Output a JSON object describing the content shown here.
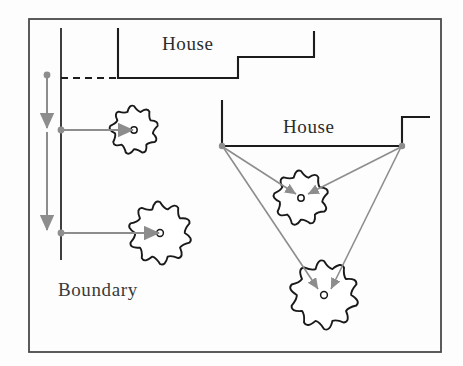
{
  "figure": {
    "title_visible": false,
    "background_color": "#fdfdfd",
    "frame": {
      "name": "outer-frame",
      "x": 29,
      "y": 19,
      "width": 412,
      "height": 333,
      "stroke": "#4a4a4a",
      "stroke_width": 1.8
    }
  },
  "labels": {
    "house_top": "House",
    "house_right": "House",
    "boundary": "Boundary"
  },
  "label_positions": {
    "house_top": {
      "x": 162,
      "y": 50
    },
    "house_right": {
      "x": 283,
      "y": 133
    },
    "boundary": {
      "x": 58,
      "y": 296
    }
  },
  "colors": {
    "structure_stroke": "#1c1c1c",
    "frame_stroke": "#4a4a4a",
    "arrow_grey": "#8d8d8d",
    "tree_stroke": "#1a1a1a",
    "tree_fill": "#ffffff",
    "text": "#2b2b2b"
  },
  "boundary_line": {
    "name": "boundary-vertical-line",
    "x": 61,
    "y_top": 28,
    "y_bottom": 260,
    "stroke": "#1c1c1c",
    "stroke_width": 1.6
  },
  "dashed_setback": {
    "name": "dashed-setback-line",
    "x1": 61,
    "y1": 78,
    "x2": 118,
    "y2": 78,
    "dash": "7,5",
    "stroke": "#1c1c1c",
    "stroke_width": 1.8
  },
  "houses": [
    {
      "id": "house-top",
      "label": "House",
      "points": "118,28 118,78 238,78 238,57 314,57 314,31",
      "stroke": "#1c1c1c",
      "stroke_width": 2.0
    },
    {
      "id": "house-right",
      "label": "House",
      "points": "222,100 222,146 402,146 402,117 430,117",
      "stroke": "#1c1c1c",
      "stroke_width": 2.0
    }
  ],
  "trees": [
    {
      "id": "tree-upper-left",
      "cx": 134,
      "cy": 130,
      "r": 24,
      "lobes": 9,
      "core_r": 3.2
    },
    {
      "id": "tree-lower-left",
      "cx": 160,
      "cy": 233,
      "r": 31,
      "lobes": 10,
      "core_r": 3.4
    },
    {
      "id": "tree-mid-right",
      "cx": 301,
      "cy": 198,
      "r": 27,
      "lobes": 9,
      "core_r": 3.2
    },
    {
      "id": "tree-lower-right",
      "cx": 324,
      "cy": 295,
      "r": 34,
      "lobes": 10,
      "core_r": 3.4
    }
  ],
  "measure_column": {
    "name": "vertical-measure-arrows",
    "x": 47,
    "dot": {
      "x": 47,
      "y": 75,
      "r": 3.4
    },
    "arrow_segments": [
      {
        "from_y": 75,
        "to_y": 130
      },
      {
        "from_y": 130,
        "to_y": 232
      }
    ],
    "stroke": "#8d8d8d",
    "stroke_width": 2.0
  },
  "horizontal_arrows": [
    {
      "id": "arrow-to-tree-upper-left",
      "x1": 61,
      "y1": 130,
      "x2": 134,
      "y2": 130,
      "origin_dot": true
    },
    {
      "id": "arrow-to-tree-lower-left",
      "x1": 61,
      "y1": 233,
      "x2": 160,
      "y2": 233,
      "origin_dot": true
    }
  ],
  "radial_arrows": [
    {
      "id": "arrow-left-corner-to-mid-tree",
      "x1": 222,
      "y1": 146,
      "x2": 301,
      "y2": 198,
      "origin_dot": true
    },
    {
      "id": "arrow-right-corner-to-mid-tree",
      "x1": 402,
      "y1": 146,
      "x2": 301,
      "y2": 198,
      "origin_dot": true
    },
    {
      "id": "arrow-left-corner-to-lower-tree",
      "x1": 222,
      "y1": 146,
      "x2": 324,
      "y2": 295,
      "origin_dot": true
    },
    {
      "id": "arrow-right-corner-to-lower-tree",
      "x1": 402,
      "y1": 146,
      "x2": 324,
      "y2": 295,
      "origin_dot": true
    }
  ],
  "legend_note": ""
}
